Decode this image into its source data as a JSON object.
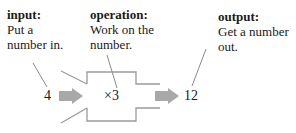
{
  "labels": {
    "input": {
      "head": "input:",
      "line1": "Put a",
      "line2": "number in."
    },
    "operation": {
      "head": "operation:",
      "line1": "Work on the",
      "line2": "number."
    },
    "output": {
      "head": "output:",
      "line1": "Get a number",
      "line2": "out."
    }
  },
  "machine": {
    "input_value": "4",
    "operation": "×3",
    "output_value": "12"
  },
  "colors": {
    "outline": "#9a9a9a",
    "arrow": "#a8a8a8",
    "leader": "#8a8a8a",
    "text": "#1a1a1a"
  }
}
